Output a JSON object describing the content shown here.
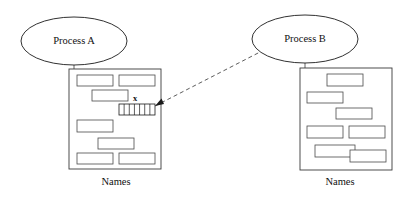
{
  "diagram": {
    "type": "process-memory-reference-diagram",
    "background_color": "#ffffff",
    "stroke_color": "#1a1a1a",
    "processes": [
      {
        "id": "process-a",
        "label": "Process A",
        "ellipse": {
          "cx": 74,
          "cy": 41,
          "rx": 53,
          "ry": 24
        }
      },
      {
        "id": "process-b",
        "label": "Process B",
        "ellipse": {
          "cx": 305,
          "cy": 39,
          "rx": 53,
          "ry": 24
        }
      }
    ],
    "memory_boxes": [
      {
        "id": "names-box-a",
        "caption": "Names",
        "caption_position": {
          "x": 116,
          "y": 185
        },
        "frame": {
          "x": 69,
          "y": 69,
          "width": 92,
          "height": 100
        },
        "blocks": [
          {
            "x": 77,
            "y": 75,
            "width": 36,
            "height": 11
          },
          {
            "x": 119,
            "y": 75,
            "width": 36,
            "height": 11
          },
          {
            "x": 92,
            "y": 90,
            "width": 36,
            "height": 11
          },
          {
            "x": 77,
            "y": 120,
            "width": 36,
            "height": 12
          },
          {
            "x": 98,
            "y": 138,
            "width": 36,
            "height": 11
          },
          {
            "x": 77,
            "y": 153,
            "width": 36,
            "height": 11
          },
          {
            "x": 119,
            "y": 153,
            "width": 36,
            "height": 11
          }
        ],
        "hatched_block": {
          "label": "x",
          "label_position": {
            "x": 135,
            "y": 101
          },
          "x": 119,
          "y": 104,
          "width": 36,
          "height": 11,
          "segments": 7
        }
      },
      {
        "id": "names-box-b",
        "caption": "Names",
        "caption_position": {
          "x": 340,
          "y": 185
        },
        "frame": {
          "x": 300,
          "y": 68,
          "width": 92,
          "height": 102
        },
        "blocks": [
          {
            "x": 327,
            "y": 74,
            "width": 36,
            "height": 12
          },
          {
            "x": 307,
            "y": 92,
            "width": 36,
            "height": 11
          },
          {
            "x": 336,
            "y": 108,
            "width": 36,
            "height": 11
          },
          {
            "x": 307,
            "y": 126,
            "width": 36,
            "height": 12
          },
          {
            "x": 349,
            "y": 126,
            "width": 36,
            "height": 12
          },
          {
            "x": 315,
            "y": 145,
            "width": 40,
            "height": 12
          },
          {
            "x": 350,
            "y": 150,
            "width": 36,
            "height": 12
          }
        ]
      }
    ],
    "connectors": [
      {
        "id": "process-a-to-box",
        "from": {
          "x": 74,
          "y": 65
        },
        "to": {
          "x": 74,
          "y": 69
        },
        "style": "solid"
      },
      {
        "id": "process-b-to-box",
        "from": {
          "x": 305,
          "y": 63
        },
        "to": {
          "x": 305,
          "y": 68
        },
        "style": "solid"
      }
    ],
    "reference_link": {
      "id": "pointer-x-to-process-b",
      "style": "dashed",
      "from": {
        "x": 155,
        "y": 106
      },
      "to": {
        "x": 262,
        "y": 51
      },
      "arrow_at": "from"
    }
  }
}
